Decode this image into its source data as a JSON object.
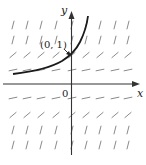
{
  "figure": {
    "type": "slope-field",
    "axes": {
      "x_label": "x",
      "y_label": "y",
      "origin_label": "0"
    },
    "point_label": "(0, 1)",
    "colors": {
      "axis": "#333333",
      "curve": "#1a1a1a",
      "segments": "#8a8a8a"
    },
    "rows": [
      {
        "y": 25,
        "slope": "steep"
      },
      {
        "y": 40,
        "slope": "steep"
      },
      {
        "y": 55,
        "slope": "medium"
      },
      {
        "y": 70,
        "slope": "shallow"
      },
      {
        "y": 98,
        "slope": "shallow"
      },
      {
        "y": 115,
        "slope": "medium"
      },
      {
        "y": 130,
        "slope": "steep"
      },
      {
        "y": 145,
        "slope": "steep"
      }
    ],
    "columns": [
      13,
      27,
      41,
      56,
      72,
      86,
      100,
      115,
      128
    ]
  }
}
